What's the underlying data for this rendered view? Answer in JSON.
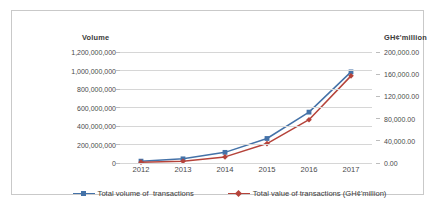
{
  "chart_data": {
    "type": "line",
    "title": "",
    "categories": [
      "2012",
      "2013",
      "2014",
      "2015",
      "2016",
      "2017"
    ],
    "x": [
      2012,
      2013,
      2014,
      2015,
      2016,
      2017
    ],
    "grid": true,
    "legend_position": "bottom",
    "axes": {
      "left": {
        "label": "Volume",
        "ylim": [
          0,
          1200000000
        ],
        "step": 200000000,
        "ticks": [
          "0",
          "200,000,000",
          "400,000,000",
          "600,000,000",
          "800,000,000",
          "1,000,000,000",
          "1,200,000,000"
        ]
      },
      "right": {
        "label": "GH¢'million",
        "ylim": [
          0,
          200000
        ],
        "step": 40000,
        "ticks": [
          "0.00",
          "40,000.00",
          "80,000.00",
          "120,000.00",
          "160,000.00",
          "200,000.00"
        ]
      },
      "x": {
        "label": ""
      }
    },
    "series": [
      {
        "name": "Total volume of  transactions",
        "axis": "left",
        "color": "#4472a8",
        "marker": "square",
        "values": [
          20000000,
          45000000,
          115000000,
          265000000,
          550000000,
          985000000
        ]
      },
      {
        "name": "Total value of transactions (GH¢'million)",
        "axis": "right",
        "color": "#b5433a",
        "marker": "diamond",
        "values": [
          1500,
          3000,
          11000,
          35000,
          78000,
          157000
        ]
      }
    ]
  },
  "colors": {
    "series_blue": "#4472a8",
    "series_red": "#b5433a",
    "gridline": "#d6d6d6",
    "border": "#c9c9c9",
    "text": "#4a4a4a"
  }
}
